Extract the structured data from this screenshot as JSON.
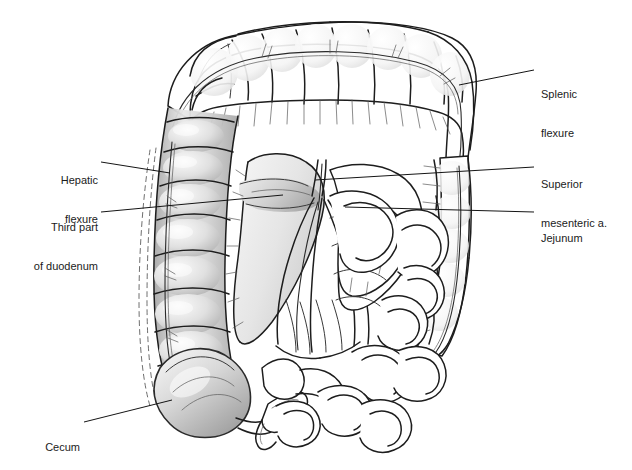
{
  "figure": {
    "background_color": "#ffffff",
    "ink_color": "#1d1d1d",
    "leader_color": "#151515",
    "shade_light": "#efefef",
    "shade_mid": "#c9c9c9",
    "shade_dark": "#9a9a9a"
  },
  "labels": [
    {
      "id": "splenic-flexure",
      "lines": [
        "Splenic",
        "flexure"
      ],
      "side": "right",
      "text_x": 541,
      "text_y": 62,
      "leader": {
        "x1": 459,
        "y1": 85,
        "x2": 534,
        "y2": 70
      }
    },
    {
      "id": "superior-mesenteric-artery",
      "lines": [
        "Superior",
        "mesenteric a."
      ],
      "side": "right",
      "text_x": 541,
      "text_y": 152,
      "leader": {
        "x1": 315,
        "y1": 180,
        "x2": 534,
        "y2": 167
      }
    },
    {
      "id": "jejunum",
      "lines": [
        "Jejunum"
      ],
      "side": "right",
      "text_x": 541,
      "text_y": 206,
      "leader": {
        "x1": 345,
        "y1": 207,
        "x2": 534,
        "y2": 212
      }
    },
    {
      "id": "hepatic-flexure",
      "lines": [
        "Hepatic",
        "flexure"
      ],
      "side": "left",
      "text_x": 98,
      "text_y": 148,
      "leader": {
        "x1": 101,
        "y1": 162,
        "x2": 170,
        "y2": 173
      }
    },
    {
      "id": "third-part-of-duodenum",
      "lines": [
        "Third part",
        "of duodenum"
      ],
      "side": "left",
      "text_x": 98,
      "text_y": 195,
      "leader": {
        "x1": 101,
        "y1": 212,
        "x2": 283,
        "y2": 195
      }
    },
    {
      "id": "cecum",
      "lines": [
        "Cecum"
      ],
      "side": "left",
      "text_x": 82,
      "text_y": 418,
      "leader": {
        "x1": 84,
        "y1": 422,
        "x2": 172,
        "y2": 400
      }
    }
  ],
  "structures": [
    {
      "id": "transverse-colon",
      "name": "Transverse colon"
    },
    {
      "id": "ascending-colon",
      "name": "Ascending colon"
    },
    {
      "id": "descending-colon",
      "name": "Descending colon"
    },
    {
      "id": "cecum-body",
      "name": "Cecum"
    },
    {
      "id": "appendix",
      "name": "Appendix"
    },
    {
      "id": "terminal-ileum",
      "name": "Terminal ileum"
    },
    {
      "id": "mesentery-fan",
      "name": "Mesentery"
    },
    {
      "id": "sma-trunk",
      "name": "Superior mesenteric artery"
    },
    {
      "id": "jejunal-loops",
      "name": "Jejunal loops"
    },
    {
      "id": "ileal-loops",
      "name": "Ileal loops"
    },
    {
      "id": "duodenum-third-part",
      "name": "Third part of duodenum"
    },
    {
      "id": "marginal-artery",
      "name": "Marginal artery of colon"
    }
  ]
}
